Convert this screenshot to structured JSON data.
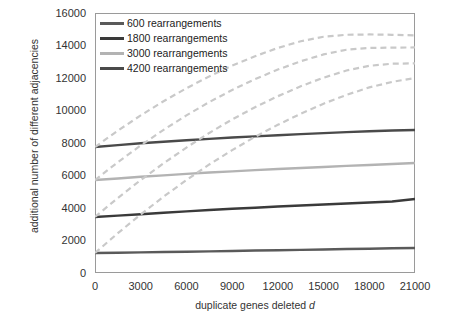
{
  "chart_data": {
    "type": "line",
    "title": "",
    "xlabel": "duplicate genes deleted d",
    "ylabel": "additional number of different adjacencies",
    "xlim": [
      0,
      21000
    ],
    "ylim": [
      0,
      16000
    ],
    "xticks": [
      "0",
      "3000",
      "6000",
      "9000",
      "12000",
      "15000",
      "18000",
      "21000"
    ],
    "yticks": [
      "0",
      "2000",
      "4000",
      "6000",
      "8000",
      "10000",
      "12000",
      "14000",
      "16000"
    ],
    "grid": false,
    "legend_position": "top-left",
    "x": [
      0,
      1500,
      3000,
      4500,
      6000,
      7500,
      9000,
      10500,
      12000,
      13500,
      15000,
      16500,
      18000,
      19500,
      21000
    ],
    "series": [
      {
        "name": "600 rearrangements",
        "color": "#5a5a5a",
        "style": "solid",
        "values": [
          1230,
          1250,
          1270,
          1290,
          1310,
          1330,
          1355,
          1380,
          1400,
          1425,
          1450,
          1475,
          1495,
          1520,
          1540
        ]
      },
      {
        "name": "1800 rearrangements",
        "color": "#3a3a3a",
        "style": "solid",
        "values": [
          3450,
          3530,
          3620,
          3710,
          3795,
          3875,
          3950,
          4020,
          4090,
          4155,
          4215,
          4280,
          4340,
          4400,
          4550
        ]
      },
      {
        "name": "3000 rearrangements",
        "color": "#b3b3b3",
        "style": "solid",
        "values": [
          5720,
          5820,
          5920,
          6010,
          6100,
          6180,
          6255,
          6330,
          6400,
          6465,
          6525,
          6590,
          6650,
          6710,
          6770
        ]
      },
      {
        "name": "4200 rearrangements",
        "color": "#4a4a4a",
        "style": "solid",
        "values": [
          7750,
          7870,
          7980,
          8080,
          8170,
          8255,
          8335,
          8410,
          8480,
          8545,
          8610,
          8670,
          8725,
          8770,
          8800
        ]
      },
      {
        "name": "600 rearrangements upper",
        "color": "#c9c9c9",
        "style": "dashed",
        "values": [
          1230,
          2450,
          3600,
          4700,
          5720,
          6680,
          7560,
          8380,
          9120,
          9800,
          10420,
          10960,
          11420,
          11760,
          12000
        ]
      },
      {
        "name": "1800 rearrangements upper",
        "color": "#c9c9c9",
        "style": "dashed",
        "values": [
          3450,
          4620,
          5720,
          6750,
          7720,
          8620,
          9450,
          10200,
          10880,
          11490,
          12020,
          12460,
          12750,
          12880,
          12900
        ]
      },
      {
        "name": "3000 rearrangements upper",
        "color": "#c9c9c9",
        "style": "dashed",
        "values": [
          5720,
          6820,
          7850,
          8810,
          9700,
          10520,
          11260,
          11930,
          12520,
          13030,
          13450,
          13740,
          13850,
          13870,
          13880
        ]
      },
      {
        "name": "4200 rearrangements upper",
        "color": "#c9c9c9",
        "style": "dashed",
        "values": [
          7750,
          8760,
          9700,
          10570,
          11370,
          12100,
          12760,
          13340,
          13850,
          14260,
          14540,
          14660,
          14680,
          14660,
          14620
        ]
      }
    ]
  },
  "legend": {
    "items": [
      {
        "label": "600 rearrangements",
        "color": "#5a5a5a"
      },
      {
        "label": "1800 rearrangements",
        "color": "#3a3a3a"
      },
      {
        "label": "3000 rearrangements",
        "color": "#b3b3b3"
      },
      {
        "label": "4200 rearrangements",
        "color": "#4a4a4a"
      }
    ]
  },
  "axes": {
    "y_title": "additional number of different adjacencies",
    "x_title_pre": "duplicate genes deleted ",
    "x_title_italic": "d"
  }
}
